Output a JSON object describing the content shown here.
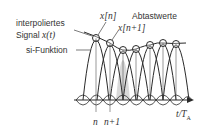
{
  "labels": {
    "interpolated_line1": "interpoliertes",
    "interpolated_line2": "Signal",
    "interpolated_signal": "x(t)",
    "sinc": "si-Funktion",
    "samples": "Abtastwerte",
    "xn": "x[n]",
    "xn1": "x[n+1]",
    "tick_n": "n",
    "tick_n1": "n+1",
    "axis": "t/T",
    "axis_sub": "A"
  },
  "diagram": {
    "samples_x": [
      96,
      110,
      123,
      136,
      150,
      163,
      176
    ],
    "samples_y": [
      38,
      43,
      50,
      49,
      45,
      43,
      44
    ],
    "baseline_y": 100,
    "colors": {
      "line": "#2a2a2a",
      "fill": "#cfcfcf"
    }
  }
}
